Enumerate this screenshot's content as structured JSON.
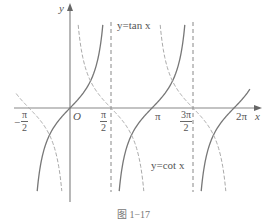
{
  "chart_data": {
    "type": "line",
    "title": "",
    "caption": "图 1-17",
    "xlabel": "x",
    "ylabel": "y",
    "origin_label": "O",
    "xlim": [
      -1.9,
      6.7
    ],
    "ylim": [
      -3.2,
      3.2
    ],
    "x_ticks": [
      {
        "value": -1.5708,
        "label_num": "π",
        "label_den": "2",
        "sign": "-"
      },
      {
        "value": 1.5708,
        "label_num": "π",
        "label_den": "2"
      },
      {
        "value": 3.1416,
        "label": "π"
      },
      {
        "value": 4.7124,
        "label_num": "3π",
        "label_den": "2"
      },
      {
        "value": 6.2832,
        "label": "2π"
      }
    ],
    "asymptotes_tan": [
      1.5708,
      4.7124
    ],
    "series": [
      {
        "name": "y=tan x",
        "style": "solid",
        "color": "#777777",
        "function": "tan",
        "branches": [
          [
            -1.5708,
            1.5708
          ],
          [
            1.5708,
            4.7124
          ],
          [
            4.7124,
            7.854
          ]
        ]
      },
      {
        "name": "y=cot x",
        "style": "dashed",
        "color": "#aaaaaa",
        "function": "cot",
        "branches": [
          [
            -3.1416,
            0
          ],
          [
            0,
            3.1416
          ],
          [
            3.1416,
            6.2832
          ]
        ]
      }
    ],
    "annotations": [
      {
        "text": "y=tan x",
        "x_px": 117,
        "y_px": 20
      },
      {
        "text": "y=cot x",
        "x_px": 151,
        "y_px": 160
      }
    ]
  },
  "labels": {
    "x_axis": "x",
    "y_axis": "y",
    "origin": "O",
    "tan_label": "y=tan x",
    "cot_label": "y=cot x",
    "neg_pi_half_num": "π",
    "neg_pi_half_den": "2",
    "neg_sign": "−",
    "pi_half_num": "π",
    "pi_half_den": "2",
    "pi": "π",
    "three_pi_half_num": "3π",
    "three_pi_half_den": "2",
    "two_pi": "2π",
    "caption": "图 1−17"
  }
}
